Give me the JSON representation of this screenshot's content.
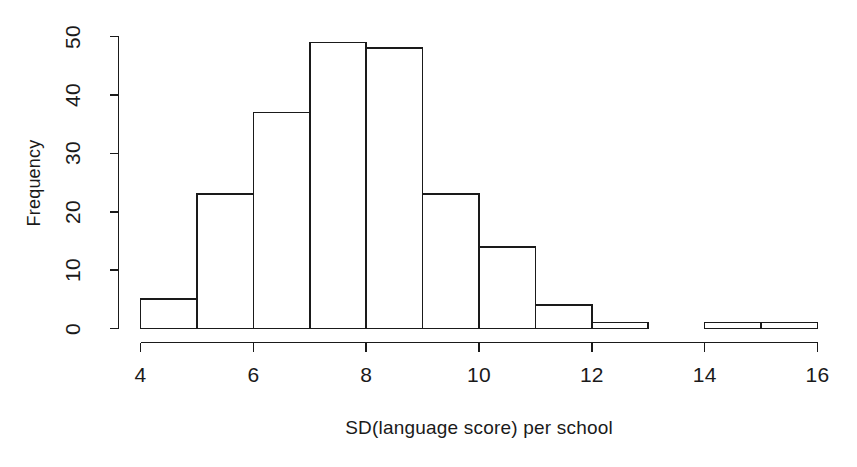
{
  "chart_data": {
    "type": "bar",
    "title": "",
    "subtitle": "",
    "xlabel": "SD(language score) per school",
    "ylabel": "Frequency",
    "grid": false,
    "legend": "none",
    "bin_width": 1,
    "xlim": [
      4,
      16
    ],
    "ylim": [
      0,
      50
    ],
    "xticks": [
      "4",
      "6",
      "8",
      "10",
      "12",
      "14",
      "16"
    ],
    "xtick_values": [
      4,
      6,
      8,
      10,
      12,
      14,
      16
    ],
    "yticks": [
      "0",
      "10",
      "20",
      "30",
      "40",
      "50"
    ],
    "ytick_values": [
      0,
      10,
      20,
      30,
      40,
      50
    ],
    "categories": [
      "4-5",
      "5-6",
      "6-7",
      "7-8",
      "8-9",
      "9-10",
      "10-11",
      "11-12",
      "12-13",
      "13-14",
      "14-15",
      "15-16"
    ],
    "bin_edges": [
      4,
      5,
      6,
      7,
      8,
      9,
      10,
      11,
      12,
      13,
      14,
      15,
      16
    ],
    "values": [
      5,
      23,
      37,
      49,
      48,
      23,
      14,
      4,
      1,
      0,
      1,
      1
    ],
    "bar_face_color": "#ffffff",
    "bar_edge_color": "#1a1a1a",
    "axis_color": "#1a1a1a"
  }
}
